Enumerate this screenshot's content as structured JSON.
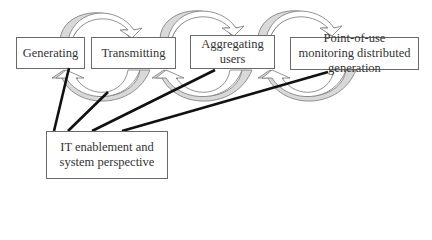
{
  "diagram": {
    "nodes": [
      {
        "id": "generating",
        "label": "Generating"
      },
      {
        "id": "transmitting",
        "label": "Transmitting"
      },
      {
        "id": "aggregating",
        "label": "Aggregating users"
      },
      {
        "id": "pointofuse",
        "label": "Point-of-use monitoring distributed generation"
      }
    ],
    "hub": {
      "id": "it",
      "label": "IT enablement and system perspective"
    },
    "edges": [
      {
        "from": "it",
        "to": "generating"
      },
      {
        "from": "it",
        "to": "transmitting"
      },
      {
        "from": "it",
        "to": "aggregating"
      },
      {
        "from": "it",
        "to": "pointofuse"
      }
    ],
    "cycle_arrows": 3,
    "colors": {
      "arrow_fill": "#d9d9d9",
      "arrow_stroke": "#777777",
      "line": "#111111",
      "box_border": "#6a6a6a"
    }
  }
}
